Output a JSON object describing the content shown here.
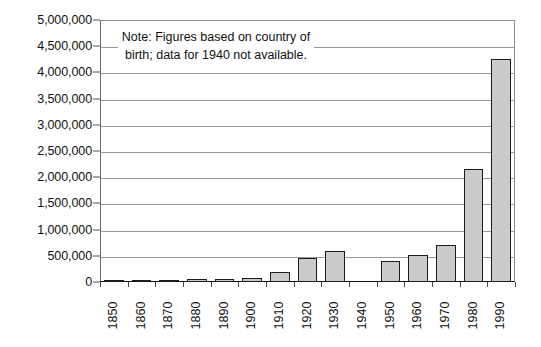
{
  "chart_data": {
    "type": "bar",
    "title": "",
    "subtitle": "",
    "xlabel": "",
    "ylabel": "",
    "categories": [
      "1850",
      "1860",
      "1870",
      "1880",
      "1890",
      "1900",
      "1910",
      "1920",
      "1930",
      "1940",
      "1950",
      "1960",
      "1970",
      "1980",
      "1990"
    ],
    "values": [
      15000,
      25000,
      40000,
      60000,
      65000,
      80000,
      200000,
      450000,
      600000,
      null,
      400000,
      520000,
      700000,
      2150000,
      4250000
    ],
    "ylim": [
      0,
      5000000
    ],
    "ytick_labels": [
      "0",
      "500,000",
      "1,000,000",
      "1,500,000",
      "2,000,000",
      "2,500,000",
      "3,000,000",
      "3,500,000",
      "4,000,000",
      "4,500,000",
      "5,000,000"
    ],
    "ytick_values": [
      0,
      500000,
      1000000,
      1500000,
      2000000,
      2500000,
      3000000,
      3500000,
      4000000,
      4500000,
      5000000
    ],
    "grid": true,
    "legend": "none",
    "missing_category": "1940",
    "bar_fill_color": "#cbcbcb",
    "bar_border_color": "#1b1b1b",
    "gridline_color": "#9a9a9a",
    "annotations": [
      {
        "name": "data-source-note",
        "text": "Note: Figures based on country of birth; data for 1940 not available."
      }
    ]
  }
}
